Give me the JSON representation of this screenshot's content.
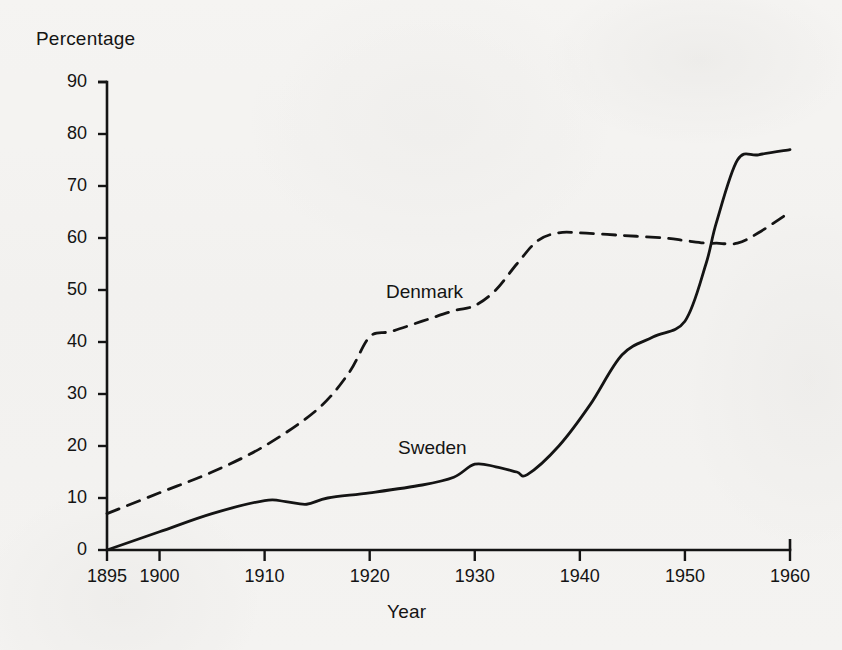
{
  "figure": {
    "background_color": "#f4f3f1",
    "ink_color": "#141414"
  },
  "axis_titles": {
    "y": "Percentage",
    "x": "Year"
  },
  "series_labels": {
    "denmark": "Denmark",
    "sweden": "Sweden"
  },
  "chart_data": {
    "type": "line",
    "title": "",
    "subtitle": "",
    "xlabel": "Year",
    "ylabel": "Percentage",
    "xlim": [
      1895,
      1960
    ],
    "ylim": [
      0,
      90
    ],
    "grid": false,
    "legend": "inline-labels",
    "xticks": [
      1895,
      1900,
      1910,
      1920,
      1930,
      1940,
      1950,
      1960
    ],
    "xtick_labels": [
      "1895",
      "1900",
      "1910",
      "1920",
      "1930",
      "1940",
      "1950",
      "1960"
    ],
    "yticks": [
      0,
      10,
      20,
      30,
      40,
      50,
      60,
      70,
      80,
      90
    ],
    "ytick_labels": [
      "0",
      "10",
      "20",
      "30",
      "40",
      "50",
      "60",
      "70",
      "80",
      "90"
    ],
    "series": [
      {
        "name": "Denmark",
        "style": "dashed",
        "color": "#141414",
        "x": [
          1895,
          1900,
          1905,
          1910,
          1915,
          1918,
          1920,
          1922,
          1925,
          1928,
          1930,
          1932,
          1934,
          1936,
          1938,
          1940,
          1944,
          1948,
          1950,
          1952,
          1953,
          1955,
          1957,
          1960
        ],
        "values": [
          7,
          11,
          15,
          20,
          27,
          34,
          41,
          42,
          44,
          46,
          47,
          50,
          55,
          59.5,
          61,
          61,
          60.5,
          60,
          59.5,
          59,
          59,
          59,
          61,
          65
        ]
      },
      {
        "name": "Sweden",
        "style": "solid",
        "color": "#141414",
        "x": [
          1895,
          1900,
          1905,
          1910,
          1912,
          1914,
          1916,
          1920,
          1925,
          1928,
          1930,
          1932,
          1934,
          1935,
          1938,
          1941,
          1944,
          1947,
          1950,
          1952,
          1953,
          1955,
          1957,
          1960
        ],
        "values": [
          0,
          3.5,
          7,
          9.5,
          9.3,
          8.8,
          10,
          11,
          12.5,
          14,
          16.5,
          16,
          15,
          14.5,
          20,
          28,
          37.5,
          41,
          44,
          55,
          63,
          75,
          76,
          77
        ]
      }
    ],
    "annotations": [
      {
        "text": "Denmark",
        "x": 1921,
        "y": 50
      },
      {
        "text": "Sweden",
        "x": 1923,
        "y": 21
      }
    ]
  }
}
